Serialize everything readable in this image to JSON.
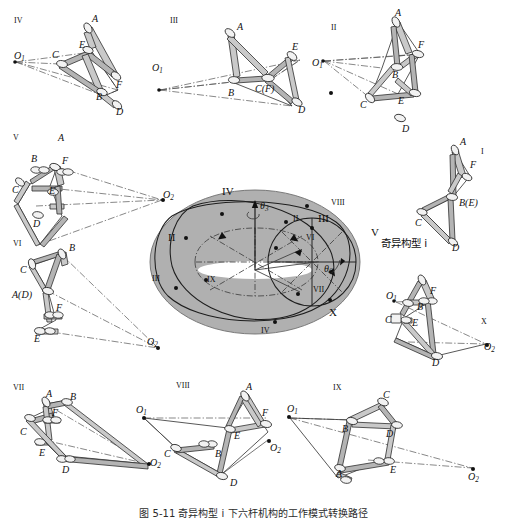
{
  "figure": {
    "caption": "图 5-11  奇异构型 i 下六杆机构的工作模式转换路径",
    "surface_label": "singularity-surface"
  },
  "center": {
    "angle_labels": [
      {
        "name": "theta3",
        "text": "θ",
        "sub": "3"
      },
      {
        "name": "theta6",
        "text": "θ",
        "sub": "6"
      }
    ],
    "roman_upper": [
      {
        "id": "II",
        "text": "II"
      },
      {
        "id": "III",
        "text": "III"
      },
      {
        "id": "IV",
        "text": "IV"
      },
      {
        "id": "V",
        "text": "V"
      },
      {
        "id": "X",
        "text": "X"
      }
    ],
    "roman_lower": [
      {
        "id": "ii",
        "text": "ii"
      },
      {
        "id": "iii",
        "text": "iii"
      },
      {
        "id": "iv",
        "text": "iv"
      },
      {
        "id": "vi",
        "text": "vi"
      },
      {
        "id": "vii",
        "text": "vii"
      },
      {
        "id": "viii",
        "text": "viii"
      },
      {
        "id": "ix",
        "text": "ix"
      }
    ],
    "annotation_cn": "奇异构型 i"
  },
  "mechanisms": [
    {
      "id": "iv",
      "numeral": "iv",
      "joint_labels": [
        "A",
        "B",
        "C",
        "D",
        "E",
        "F"
      ],
      "pole_labels": [
        {
          "text": "O",
          "sub": "1"
        }
      ]
    },
    {
      "id": "iii",
      "numeral": "iii",
      "joint_labels": [
        "A",
        "B",
        "C(F)",
        "D",
        "E"
      ],
      "pole_labels": [
        {
          "text": "O",
          "sub": "1"
        }
      ]
    },
    {
      "id": "ii",
      "numeral": "ii",
      "joint_labels": [
        "A",
        "B",
        "C",
        "D",
        "E",
        "F"
      ],
      "pole_labels": [
        {
          "text": "O",
          "sub": "1"
        }
      ]
    },
    {
      "id": "i",
      "numeral": "i",
      "joint_labels": [
        "A",
        "B(E)",
        "C",
        "D",
        "F"
      ],
      "pole_labels": []
    },
    {
      "id": "v",
      "numeral": "v",
      "joint_labels": [
        "A",
        "B",
        "C",
        "D",
        "E",
        "F"
      ],
      "pole_labels": [
        {
          "text": "O",
          "sub": "2"
        }
      ]
    },
    {
      "id": "vi",
      "numeral": "vi",
      "joint_labels": [
        "A(D)",
        "B",
        "C",
        "E",
        "F"
      ],
      "pole_labels": [
        {
          "text": "O",
          "sub": "2"
        }
      ]
    },
    {
      "id": "x",
      "numeral": "x",
      "joint_labels": [
        "B",
        "C",
        "D",
        "E",
        "F"
      ],
      "pole_labels": [
        {
          "text": "O",
          "sub": "1"
        },
        {
          "text": "O",
          "sub": "2"
        }
      ]
    },
    {
      "id": "vii",
      "numeral": "vii",
      "joint_labels": [
        "A",
        "B",
        "C",
        "D",
        "E",
        "F"
      ],
      "pole_labels": [
        {
          "text": "O",
          "sub": "2"
        }
      ]
    },
    {
      "id": "viii",
      "numeral": "viii",
      "joint_labels": [
        "A",
        "B",
        "C",
        "D",
        "E",
        "F"
      ],
      "pole_labels": [
        {
          "text": "O",
          "sub": "1"
        },
        {
          "text": "O",
          "sub": "2"
        }
      ]
    },
    {
      "id": "ix",
      "numeral": "ix",
      "joint_labels": [
        "A",
        "B",
        "C",
        "D",
        "E"
      ],
      "pole_labels": [
        {
          "text": "O",
          "sub": "1"
        },
        {
          "text": "O",
          "sub": "2"
        }
      ]
    }
  ]
}
